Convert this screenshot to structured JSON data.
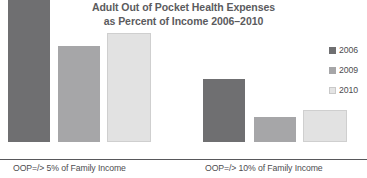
{
  "chart_data": {
    "type": "bar",
    "title": "Adult Out of Pocket Health Expenses as Percent of Income 2006–2010",
    "title_line1": "Adult Out of Pocket Health Expenses",
    "title_line2": "as Percent of Income 2006–2010",
    "xlabel": "",
    "ylabel": "",
    "grid": false,
    "legend_position": "right",
    "categories": [
      "OOP=/> 5% of Family Income",
      "OOP=/> 10% of Family Income"
    ],
    "series": [
      {
        "name": "2006",
        "color": "#6f6f71",
        "values": [
          142,
          63
        ]
      },
      {
        "name": "2009",
        "color": "#a6a6a8",
        "values": [
          96,
          25
        ]
      },
      {
        "name": "2010",
        "color": "#e2e2e2",
        "values": [
          109,
          32
        ]
      }
    ],
    "ylim": [
      0,
      150
    ],
    "value_units": "relative bar height (px), no value axis shown",
    "bars": [
      {
        "group": 0,
        "series": "2006",
        "left": 8,
        "width": 42,
        "height": 142
      },
      {
        "group": 0,
        "series": "2009",
        "left": 58,
        "width": 42,
        "height": 96
      },
      {
        "group": 0,
        "series": "2010",
        "left": 107,
        "width": 44,
        "height": 109
      },
      {
        "group": 1,
        "series": "2006",
        "left": 203,
        "width": 42,
        "height": 63
      },
      {
        "group": 1,
        "series": "2009",
        "left": 254,
        "width": 42,
        "height": 25
      },
      {
        "group": 1,
        "series": "2010",
        "left": 303,
        "width": 44,
        "height": 32
      }
    ]
  },
  "legend": {
    "items": [
      {
        "label": "2006"
      },
      {
        "label": "2009"
      },
      {
        "label": "2010"
      }
    ]
  }
}
